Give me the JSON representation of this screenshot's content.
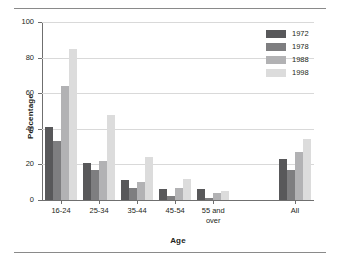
{
  "chart_data": {
    "type": "bar",
    "title": "",
    "xlabel": "Age",
    "ylabel": "Percentage",
    "ylim": [
      0,
      100
    ],
    "yticks": [
      0,
      20,
      40,
      60,
      80,
      100
    ],
    "grid": true,
    "legend_position": "top-right",
    "categories": [
      "16-24",
      "25-34",
      "35-44",
      "45-54",
      "55 and over",
      "All"
    ],
    "series": [
      {
        "name": "1972",
        "color": "#58585a",
        "values": [
          41,
          21,
          11,
          6,
          6,
          23
        ]
      },
      {
        "name": "1978",
        "color": "#7e7e80",
        "values": [
          33,
          17,
          7,
          2,
          1,
          17
        ]
      },
      {
        "name": "1988",
        "color": "#b2b2b4",
        "values": [
          64,
          22,
          10,
          7,
          4,
          27
        ]
      },
      {
        "name": "1998",
        "color": "#dcdcdc",
        "values": [
          85,
          48,
          24,
          12,
          5,
          34
        ]
      }
    ]
  },
  "axes": {
    "y_title": "Percentage",
    "x_title": "Age",
    "y_tick_labels": [
      "0",
      "20",
      "40",
      "60",
      "80",
      "100"
    ]
  },
  "legend": {
    "entries": [
      {
        "label": "1972"
      },
      {
        "label": "1978"
      },
      {
        "label": "1988"
      },
      {
        "label": "1998"
      }
    ]
  }
}
